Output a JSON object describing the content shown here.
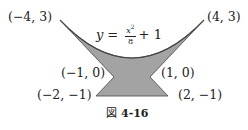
{
  "figure": {
    "caption_prefix": "図",
    "caption_number": "4-16",
    "equation": {
      "lhs": "y",
      "equals": "=",
      "numerator": "x",
      "exponent": "2",
      "denominator": "8",
      "tail": "+ 1"
    },
    "points": [
      {
        "label": "(−4, 3)",
        "x": -4,
        "y": 3
      },
      {
        "label": "(4, 3)",
        "x": 4,
        "y": 3
      },
      {
        "label": "(−1, 0)",
        "x": -1,
        "y": 0
      },
      {
        "label": "(1, 0)",
        "x": 1,
        "y": 0
      },
      {
        "label": "(−2, −1)",
        "x": -2,
        "y": -1
      },
      {
        "label": "(2, −1)",
        "x": 2,
        "y": -1
      }
    ],
    "region": {
      "description": "Shaded region bounded above by y = x^2/8 + 1 from (−4,3) to (4,3), with straight edges (4,3)→(1,0)→(2,−1)→(−2,−1)→(−1,0)→(−4,3)",
      "fill_color": "#a3a3a3",
      "stroke_color": "#555555"
    }
  }
}
